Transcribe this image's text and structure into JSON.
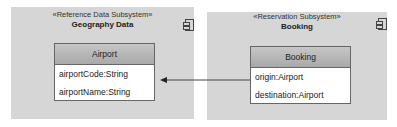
{
  "subsystems": [
    {
      "stereotype": "«Reference Data Subsystem»",
      "name": "Geography Data",
      "class": {
        "name": "Airport",
        "attributes": [
          "airportCode:String",
          "airportName:String"
        ]
      }
    },
    {
      "stereotype": "«Reservation Subsystem»",
      "name": "Booking",
      "class": {
        "name": "Booking",
        "attributes": [
          "origin:Airport",
          "destination:Airport"
        ]
      }
    }
  ],
  "association": {
    "from": "Booking",
    "to": "Airport",
    "arrow": "open-arrowhead"
  },
  "colors": {
    "subsystem_fill": "#d6d6d6",
    "class_header": "#b5b5b5",
    "line": "#444444"
  }
}
